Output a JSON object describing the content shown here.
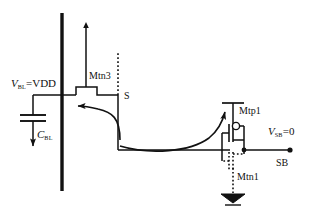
{
  "figure": {
    "kind": "circuit-schematic",
    "background_color": "#ffffff",
    "line_color": "#111111",
    "dotted_color": "#111111"
  },
  "labels": {
    "bitline_voltage": {
      "symbol": "V",
      "subscript": "BL",
      "equals": "=VDD",
      "full_text": "V_BL=VDD"
    },
    "bitline_capacitor": {
      "symbol": "C",
      "subscript": "BL",
      "full_text": "C_BL"
    },
    "pass_transistor": "Mtn3",
    "sense_node": "S",
    "pmos_transistor": "Mtp1",
    "nmos_transistor": "Mtn1",
    "sense_bar_voltage": {
      "symbol": "V",
      "subscript": "SB",
      "equals": "=0",
      "full_text": "V_SB=0"
    },
    "sense_bar_node": "SB"
  },
  "nets": {
    "bitline": "BL",
    "sense": "S",
    "sense_bar": "SB",
    "supply": "VDD",
    "ground": "GND"
  },
  "annotations": {
    "arrow_left_curve": "charge-flow-to-bitline",
    "arrow_right_curve": "discharge-flow-to-sense-bar",
    "arrow_capacitor": "capacitor-discharge-direction",
    "arrow_gate_up": "wordline-gate-drive"
  },
  "colors": {
    "ink": "#111111",
    "paper": "#ffffff"
  }
}
